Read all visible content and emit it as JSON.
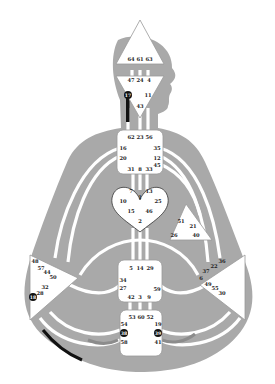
{
  "colors": {
    "body": "#a9a9a9",
    "channel": "#ffffff",
    "center_fill": "#ffffff",
    "center_stroke": "#9a9a9a",
    "active_gate": "#111111",
    "active_channel_dark": "#111111",
    "active_channel_gray": "#8c8c8c"
  },
  "centers": {
    "head": {
      "gates": [
        "64",
        "61",
        "63"
      ]
    },
    "ajna": {
      "gates": [
        "47",
        "24",
        "4",
        "17",
        "11",
        "43"
      ],
      "active_gates": [
        "17"
      ]
    },
    "throat": {
      "gates": [
        "62",
        "23",
        "56",
        "16",
        "35",
        "20",
        "12",
        "31",
        "8",
        "33",
        "45"
      ]
    },
    "g": {
      "gates": [
        "7",
        "1",
        "13",
        "10",
        "25",
        "15",
        "46",
        "2"
      ]
    },
    "ego": {
      "gates": [
        "51",
        "21",
        "26",
        "40"
      ]
    },
    "spleen": {
      "gates": [
        "48",
        "57",
        "44",
        "50",
        "32",
        "28",
        "18"
      ],
      "active_gates": [
        "18"
      ]
    },
    "solar_plexus": {
      "gates": [
        "36",
        "22",
        "37",
        "6",
        "49",
        "55",
        "30"
      ]
    },
    "sacral": {
      "gates": [
        "5",
        "14",
        "29",
        "34",
        "27",
        "59",
        "42",
        "3",
        "9"
      ]
    },
    "root": {
      "gates": [
        "53",
        "60",
        "52",
        "54",
        "38",
        "58",
        "19",
        "39",
        "41"
      ],
      "active_gates": [
        "38",
        "39"
      ]
    }
  }
}
